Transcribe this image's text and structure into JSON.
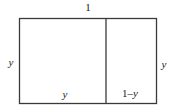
{
  "diagram": {
    "title": "",
    "type": "rectangle-partition",
    "stroke_color": "#3a3a3a",
    "background_color": "#ffffff",
    "outer_rect": {
      "x": 19.5,
      "y": 18.5,
      "width": 137,
      "height": 85
    },
    "divider_x": 106,
    "labels": {
      "top": "1",
      "left": "y",
      "right": "y",
      "bottom_left": "y",
      "bottom_right": "1–y"
    }
  }
}
